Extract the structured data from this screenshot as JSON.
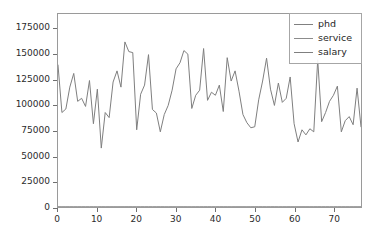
{
  "chart_data": {
    "type": "line",
    "title": "",
    "xlabel": "",
    "ylabel": "",
    "xlim": [
      0,
      77
    ],
    "ylim": [
      0,
      190000
    ],
    "grid": false,
    "legend_position": "upper right",
    "xticks": [
      0,
      10,
      20,
      30,
      40,
      50,
      60,
      70
    ],
    "yticks": [
      0,
      25000,
      50000,
      75000,
      100000,
      125000,
      150000,
      175000
    ],
    "xtick_labels": [
      "0",
      "10",
      "20",
      "30",
      "40",
      "50",
      "60",
      "70"
    ],
    "ytick_labels": [
      "0",
      "25000",
      "50000",
      "75000",
      "100000",
      "125000",
      "150000",
      "175000"
    ],
    "x": [
      0,
      1,
      2,
      3,
      4,
      5,
      6,
      7,
      8,
      9,
      10,
      11,
      12,
      13,
      14,
      15,
      16,
      17,
      18,
      19,
      20,
      21,
      22,
      23,
      24,
      25,
      26,
      27,
      28,
      29,
      30,
      31,
      32,
      33,
      34,
      35,
      36,
      37,
      38,
      39,
      40,
      41,
      42,
      43,
      44,
      45,
      46,
      47,
      48,
      49,
      50,
      51,
      52,
      53,
      54,
      55,
      56,
      57,
      58,
      59,
      60,
      61,
      62,
      63,
      64,
      65,
      66,
      67,
      68,
      69,
      70,
      71,
      72,
      73,
      74,
      75,
      76,
      77
    ],
    "series": [
      {
        "name": "phd",
        "color": "#808080",
        "values": [
          56,
          12,
          23,
          40,
          20,
          20,
          18,
          20,
          20,
          18,
          3,
          39,
          14,
          29,
          35,
          25,
          40,
          38,
          45,
          21,
          27,
          26,
          41,
          38,
          28,
          39,
          36,
          18,
          12,
          36,
          13,
          25,
          41,
          17,
          5,
          32,
          11,
          30,
          37,
          24,
          19,
          42,
          22,
          34,
          19,
          25,
          31,
          23,
          18,
          29,
          42,
          46,
          38,
          22,
          39,
          45,
          20,
          24,
          32,
          35,
          14,
          26,
          38,
          41,
          30,
          27,
          44,
          21,
          36,
          28,
          19,
          43,
          26,
          31,
          33,
          24,
          22,
          29
        ]
      },
      {
        "name": "service",
        "color": "#8c8c8c",
        "values": [
          49,
          6,
          20,
          31,
          18,
          20,
          18,
          17,
          16,
          16,
          3,
          36,
          9,
          19,
          20,
          20,
          22,
          19,
          43,
          19,
          26,
          26,
          35,
          37,
          17,
          20,
          29,
          11,
          6,
          31,
          3,
          18,
          34,
          11,
          4,
          28,
          6,
          23,
          28,
          14,
          12,
          36,
          15,
          26,
          11,
          20,
          24,
          18,
          9,
          22,
          32,
          41,
          30,
          12,
          30,
          38,
          13,
          17,
          28,
          31,
          5,
          20,
          30,
          35,
          22,
          19,
          38,
          14,
          27,
          21,
          12,
          39,
          20,
          22,
          27,
          18,
          15,
          23
        ]
      },
      {
        "name": "salary",
        "color": "#7f7f7f",
        "values": [
          139750,
          93000,
          96500,
          118000,
          131500,
          104000,
          107000,
          99000,
          124500,
          82000,
          116000,
          58000,
          93000,
          88000,
          123000,
          134000,
          118000,
          162500,
          153000,
          152000,
          76000,
          111000,
          120000,
          150000,
          96000,
          92500,
          74000,
          91000,
          100000,
          115000,
          136000,
          142000,
          154000,
          150500,
          97000,
          110000,
          115000,
          156000,
          105000,
          113000,
          110000,
          120000,
          94000,
          147000,
          124000,
          134000,
          114000,
          91000,
          83000,
          78000,
          79000,
          105500,
          124000,
          146500,
          116000,
          100000,
          122000,
          103000,
          107000,
          128000,
          82000,
          64000,
          76000,
          71000,
          77000,
          74000,
          145000,
          84000,
          93000,
          104000,
          110000,
          119000,
          74000,
          85000,
          89000,
          81000,
          117000,
          79000
        ]
      }
    ]
  },
  "legend": {
    "entries": [
      {
        "label": "phd"
      },
      {
        "label": "service"
      },
      {
        "label": "salary"
      }
    ]
  },
  "colors": {
    "axis": "#9a9a9a",
    "tick": "#6f6f6f",
    "text": "#2b2b2b",
    "background": "#ffffff",
    "legend_border": "#a6a6a6"
  }
}
